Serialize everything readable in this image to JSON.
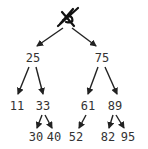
{
  "diagram": {
    "type": "binary-search-tree",
    "root": {
      "id": "root",
      "label": "",
      "deleted": true,
      "x": 68,
      "y": 18
    },
    "nodes": [
      {
        "id": "n25",
        "label": "25",
        "x": 33,
        "y": 62
      },
      {
        "id": "n75",
        "label": "75",
        "x": 102,
        "y": 62
      },
      {
        "id": "n11",
        "label": "11",
        "x": 17,
        "y": 110
      },
      {
        "id": "n33",
        "label": "33",
        "x": 43,
        "y": 110
      },
      {
        "id": "n61",
        "label": "61",
        "x": 88,
        "y": 110
      },
      {
        "id": "n89",
        "label": "89",
        "x": 115,
        "y": 110
      },
      {
        "id": "n30",
        "label": "30",
        "x": 36,
        "y": 141
      },
      {
        "id": "n40",
        "label": "40",
        "x": 54,
        "y": 141
      },
      {
        "id": "n52",
        "label": "52",
        "x": 76,
        "y": 141
      },
      {
        "id": "n82",
        "label": "82",
        "x": 108,
        "y": 141
      },
      {
        "id": "n95",
        "label": "95",
        "x": 128,
        "y": 141
      }
    ],
    "edges": [
      {
        "from": "root",
        "to": "n25",
        "x1": 63,
        "y1": 28,
        "x2": 37,
        "y2": 46
      },
      {
        "from": "root",
        "to": "n75",
        "x1": 72,
        "y1": 28,
        "x2": 96,
        "y2": 46
      },
      {
        "from": "n25",
        "to": "n11",
        "x1": 29,
        "y1": 67,
        "x2": 18,
        "y2": 94
      },
      {
        "from": "n25",
        "to": "n33",
        "x1": 36,
        "y1": 67,
        "x2": 43,
        "y2": 94
      },
      {
        "from": "n75",
        "to": "n61",
        "x1": 98,
        "y1": 67,
        "x2": 88,
        "y2": 94
      },
      {
        "from": "n75",
        "to": "n89",
        "x1": 105,
        "y1": 67,
        "x2": 117,
        "y2": 94
      },
      {
        "from": "n33",
        "to": "n30",
        "x1": 42,
        "y1": 115,
        "x2": 37,
        "y2": 128
      },
      {
        "from": "n33",
        "to": "n40",
        "x1": 45,
        "y1": 115,
        "x2": 52,
        "y2": 128
      },
      {
        "from": "n61",
        "to": "n52",
        "x1": 86,
        "y1": 115,
        "x2": 79,
        "y2": 128
      },
      {
        "from": "n89",
        "to": "n82",
        "x1": 113,
        "y1": 115,
        "x2": 109,
        "y2": 128
      },
      {
        "from": "n89",
        "to": "n95",
        "x1": 116,
        "y1": 115,
        "x2": 124,
        "y2": 128
      }
    ],
    "colors": {
      "edge": "#222222",
      "text": "#333333",
      "background": "#ffffff"
    }
  }
}
